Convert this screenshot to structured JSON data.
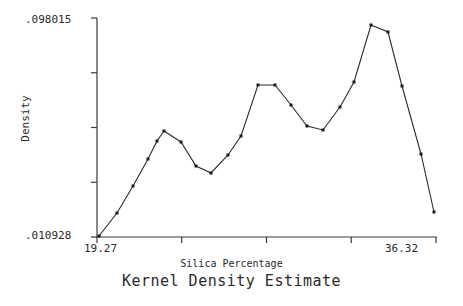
{
  "chart_data": {
    "type": "line",
    "title": "Kernel Density Estimate",
    "subtitle": "Silica Percentage",
    "xlabel": "Silica Percentage",
    "ylabel": "Density",
    "grid": false,
    "legend": null,
    "axis": {
      "x_tick_labels": [
        "19.27",
        "36.32"
      ],
      "y_tick_labels": [
        ".010928",
        ".098015"
      ],
      "xlim": [
        19.27,
        36.32
      ],
      "ylim": [
        0.010928,
        0.098015
      ],
      "x_tick_count": 5,
      "y_tick_count": 5,
      "x_minor_ticks_unlabeled": true,
      "y_minor_ticks_unlabeled": true
    },
    "markers": {
      "shape": "filled-square",
      "size_px": 3,
      "color": "#1a1a1a"
    },
    "line": {
      "color": "#2b2b2b",
      "width_px": 1
    },
    "x": [
      19.27,
      20.17,
      20.97,
      21.72,
      22.62,
      23.47,
      24.27,
      25.07,
      25.82,
      26.62,
      27.37,
      28.37,
      29.12,
      29.97,
      30.72,
      31.52,
      32.37,
      33.22,
      33.97,
      34.92,
      36.32
    ],
    "values": [
      0.010928,
      0.020067,
      0.0308,
      0.041533,
      0.052266,
      0.062602,
      0.058227,
      0.048686,
      0.045504,
      0.051869,
      0.059428,
      0.071354,
      0.071354,
      0.065387,
      0.057032,
      0.055441,
      0.064194,
      0.074138,
      0.092844,
      0.090058,
      0.075332
    ],
    "points_px": [
      [
        99,
        236
      ],
      [
        117,
        213
      ],
      [
        133,
        186
      ],
      [
        148,
        159
      ],
      [
        157,
        141
      ],
      [
        164,
        131
      ],
      [
        181,
        142
      ],
      [
        196,
        166
      ],
      [
        211,
        173
      ],
      [
        228,
        155
      ],
      [
        241,
        136
      ],
      [
        258,
        85
      ],
      [
        275,
        85
      ],
      [
        291,
        105
      ],
      [
        307,
        126
      ],
      [
        323,
        130
      ],
      [
        340,
        107
      ],
      [
        354,
        82
      ],
      [
        371,
        25
      ],
      [
        388,
        32
      ],
      [
        402,
        86
      ],
      [
        421,
        154
      ],
      [
        434,
        212
      ]
    ]
  },
  "axis_labels": {
    "y_top": ".098015",
    "y_bottom": ".010928",
    "x_left": "19.27",
    "x_right": "36.32",
    "y_title": "Density",
    "x_title": "Silica Percentage",
    "main_title": "Kernel Density Estimate"
  }
}
